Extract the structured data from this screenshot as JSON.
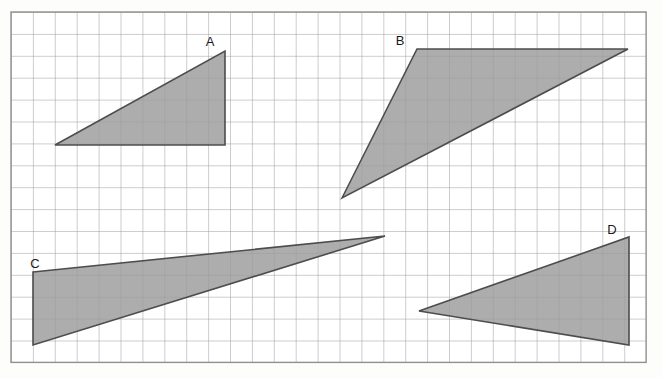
{
  "figure": {
    "canvas": {
      "width": 663,
      "height": 379
    },
    "background_color": "#fdfdfc",
    "grid": {
      "origin_x": 11,
      "origin_y": 12,
      "cell_size": 21.9,
      "cols": 29,
      "rows": 16,
      "line_color": "#9c9c9c",
      "line_width": 1,
      "border_color": "#8f8f8f",
      "border_width": 1.4,
      "visible": true
    },
    "shape_style": {
      "fill_color": "#9b9b9b",
      "fill_opacity": 0.82,
      "stroke_color": "#4d4d4d",
      "stroke_width": 1.6,
      "label_color": "#1a1a1a",
      "label_font_size": 13
    },
    "shapes": [
      {
        "id": "triangle-a",
        "label": "A",
        "label_x": 210,
        "label_y": 46,
        "points": "55,145 225,51 225,145",
        "vertices": [
          [
            55,
            145
          ],
          [
            225,
            51
          ],
          [
            225,
            145
          ]
        ],
        "grid_vertices": [
          [
            2,
            6
          ],
          [
            9.8,
            1.8
          ],
          [
            9.8,
            6
          ]
        ],
        "base_cells": 7.8,
        "height_cells": 4.3,
        "right_angle_at": "bottom-right"
      },
      {
        "id": "triangle-b",
        "label": "B",
        "label_x": 400,
        "label_y": 45,
        "points": "342,198 417,49 628,49",
        "vertices": [
          [
            342,
            198
          ],
          [
            417,
            49
          ],
          [
            628,
            49
          ]
        ],
        "grid_vertices": [
          [
            15.1,
            8.5
          ],
          [
            18.5,
            1.7
          ],
          [
            28.2,
            1.7
          ]
        ],
        "base_cells": 9.7,
        "height_cells": 6.8,
        "right_angle_at": "none"
      },
      {
        "id": "triangle-c",
        "label": "C",
        "label_x": 35,
        "label_y": 268,
        "points": "33,272 385,236 33,345",
        "vertices": [
          [
            33,
            272
          ],
          [
            385,
            236
          ],
          [
            33,
            345
          ]
        ],
        "grid_vertices": [
          [
            1.0,
            11.9
          ],
          [
            17.1,
            10.2
          ],
          [
            1.0,
            15.2
          ]
        ],
        "base_cells": 3.3,
        "height_cells": 16.1,
        "right_angle_at": "none"
      },
      {
        "id": "triangle-d",
        "label": "D",
        "label_x": 612,
        "label_y": 234,
        "points": "419,311 629,237 629,345",
        "vertices": [
          [
            419,
            311
          ],
          [
            629,
            237
          ],
          [
            629,
            345
          ]
        ],
        "grid_vertices": [
          [
            18.6,
            13.7
          ],
          [
            28.2,
            10.3
          ],
          [
            28.2,
            15.2
          ]
        ],
        "base_cells": 4.9,
        "height_cells": 9.6,
        "right_angle_at": "right"
      }
    ]
  }
}
